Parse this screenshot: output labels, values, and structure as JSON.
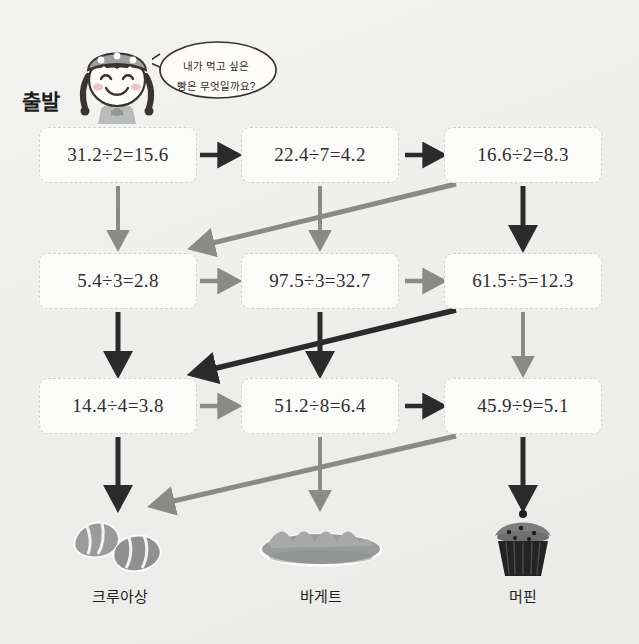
{
  "worksheet": {
    "start_label": "출발",
    "speech_bubble": {
      "line1": "내가 먹고 싶은",
      "line2": "빵은 무엇일까요?"
    },
    "character_name": "girl-with-bandana"
  },
  "colors": {
    "background": "#f0f0ee",
    "box_fill": "#fbfbfa",
    "box_border": "#d2d2cf",
    "arrow_dark": "#2b2b2b",
    "arrow_gray": "#8a8a88",
    "text": "#2e2e2e"
  },
  "grid": {
    "rows": [
      {
        "row_index": 1,
        "cells": [
          {
            "col": 1,
            "equation": "31.2÷2=15.6",
            "dividend": 31.2,
            "divisor": 2,
            "quotient": 15.6,
            "correct": false
          },
          {
            "col": 2,
            "equation": "22.4÷7=4.2",
            "dividend": 22.4,
            "divisor": 7,
            "quotient": 4.2,
            "correct": false
          },
          {
            "col": 3,
            "equation": "16.6÷2=8.3",
            "dividend": 16.6,
            "divisor": 2,
            "quotient": 8.3,
            "correct": true
          }
        ]
      },
      {
        "row_index": 2,
        "cells": [
          {
            "col": 1,
            "equation": "5.4÷3=2.8",
            "dividend": 5.4,
            "divisor": 3,
            "quotient": 2.8,
            "correct": false
          },
          {
            "col": 2,
            "equation": "97.5÷3=32.7",
            "dividend": 97.5,
            "divisor": 3,
            "quotient": 32.7,
            "correct": false
          },
          {
            "col": 3,
            "equation": "61.5÷5=12.3",
            "dividend": 61.5,
            "divisor": 5,
            "quotient": 12.3,
            "correct": true
          }
        ]
      },
      {
        "row_index": 3,
        "cells": [
          {
            "col": 1,
            "equation": "14.4÷4=3.8",
            "dividend": 14.4,
            "divisor": 4,
            "quotient": 3.8,
            "correct": false
          },
          {
            "col": 2,
            "equation": "51.2÷8=6.4",
            "dividend": 51.2,
            "divisor": 8,
            "quotient": 6.4,
            "correct": true
          },
          {
            "col": 3,
            "equation": "45.9÷9=5.1",
            "dividend": 45.9,
            "divisor": 9,
            "quotient": 5.1,
            "correct": true
          }
        ]
      }
    ]
  },
  "answers": [
    {
      "id": "croissant",
      "label": "크루아상",
      "icon": "croissant-icon"
    },
    {
      "id": "baguette",
      "label": "바게트",
      "icon": "baguette-icon"
    },
    {
      "id": "muffin",
      "label": "머핀",
      "icon": "muffin-icon"
    }
  ],
  "arrows": {
    "horizontal": [
      {
        "id": "h-r1-c1-c2",
        "row": 1,
        "from_col": 1,
        "to_col": 2,
        "color": "dark"
      },
      {
        "id": "h-r1-c2-c3",
        "row": 1,
        "from_col": 2,
        "to_col": 3,
        "color": "dark"
      },
      {
        "id": "h-r2-c1-c2",
        "row": 2,
        "from_col": 1,
        "to_col": 2,
        "color": "gray"
      },
      {
        "id": "h-r2-c2-c3",
        "row": 2,
        "from_col": 2,
        "to_col": 3,
        "color": "gray"
      },
      {
        "id": "h-r3-c1-c2",
        "row": 3,
        "from_col": 1,
        "to_col": 2,
        "color": "gray"
      },
      {
        "id": "h-r3-c2-c3",
        "row": 3,
        "from_col": 2,
        "to_col": 3,
        "color": "dark"
      }
    ],
    "vertical": [
      {
        "id": "v-c1-r1-r2",
        "col": 1,
        "from_row": 1,
        "to_row": 2,
        "color": "gray"
      },
      {
        "id": "v-c2-r1-r2",
        "col": 2,
        "from_row": 1,
        "to_row": 2,
        "color": "gray"
      },
      {
        "id": "v-c3-r1-r2",
        "col": 3,
        "from_row": 1,
        "to_row": 2,
        "color": "dark"
      },
      {
        "id": "v-c1-r2-r3",
        "col": 1,
        "from_row": 2,
        "to_row": 3,
        "color": "dark"
      },
      {
        "id": "v-c2-r2-r3",
        "col": 2,
        "from_row": 2,
        "to_row": 3,
        "color": "dark"
      },
      {
        "id": "v-c3-r2-r3",
        "col": 3,
        "from_row": 2,
        "to_row": 3,
        "color": "gray"
      },
      {
        "id": "v-c1-r3-end",
        "col": 1,
        "from_row": 3,
        "to_row": "answer",
        "color": "dark"
      },
      {
        "id": "v-c2-r3-end",
        "col": 2,
        "from_row": 3,
        "to_row": "answer",
        "color": "gray"
      },
      {
        "id": "v-c3-r3-end",
        "col": 3,
        "from_row": 3,
        "to_row": "answer",
        "color": "dark"
      }
    ],
    "diagonal": [
      {
        "id": "d-r1c3-r2c1",
        "from_row": 1,
        "from_col": 3,
        "to_row": 2,
        "to_col": 1,
        "color": "gray"
      },
      {
        "id": "d-r2c3-r3c1",
        "from_row": 2,
        "from_col": 3,
        "to_row": 3,
        "to_col": 1,
        "color": "dark"
      },
      {
        "id": "d-r3c3-croissant",
        "from_row": 3,
        "from_col": 3,
        "to_row": "answer",
        "to_col": 1,
        "color": "gray"
      }
    ]
  }
}
